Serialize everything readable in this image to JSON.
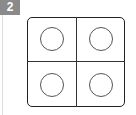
{
  "badge": {
    "label": "2",
    "color": "#8a8a8a"
  },
  "diagram": {
    "cells": [
      {
        "position": "top-left",
        "shape": "circle"
      },
      {
        "position": "top-right",
        "shape": "circle"
      },
      {
        "position": "bottom-left",
        "shape": "circle"
      },
      {
        "position": "bottom-right",
        "shape": "circle"
      }
    ],
    "stroke_color": "#222222"
  }
}
